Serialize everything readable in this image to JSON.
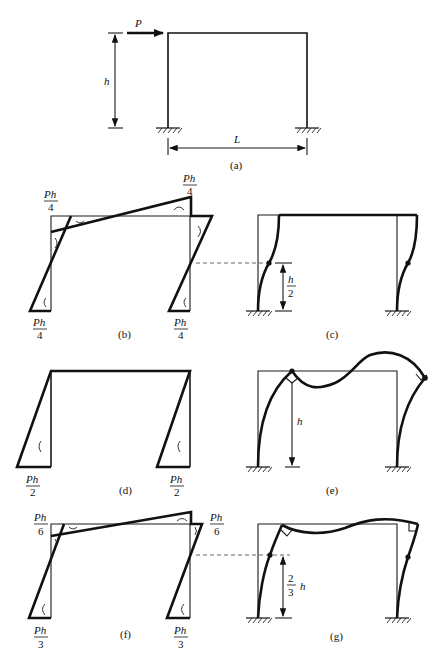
{
  "figure": {
    "panels": [
      {
        "id": "a",
        "caption": "(a)",
        "description": "Portal frame with fixed bases, horizontal load P at beam level",
        "labels": {
          "load": "P",
          "height": "h",
          "span": "L"
        }
      },
      {
        "id": "b",
        "caption": "(b)",
        "description": "Bending moment diagram, rigid beam case",
        "moment_labels": {
          "top_left_num": "Ph",
          "top_left_den": "4",
          "top_right_num": "Ph",
          "top_right_den": "4",
          "base_left_num": "Ph",
          "base_left_den": "4",
          "base_right_num": "Ph",
          "base_right_den": "4"
        }
      },
      {
        "id": "c",
        "caption": "(c)",
        "description": "Deflected shape, inflection point at mid-height",
        "labels": {
          "dim_num": "h",
          "dim_den": "2"
        }
      },
      {
        "id": "d",
        "caption": "(d)",
        "description": "Bending moment diagram, flexible beam case",
        "moment_labels": {
          "base_left_num": "Ph",
          "base_left_den": "2",
          "base_right_num": "Ph",
          "base_right_den": "2"
        }
      },
      {
        "id": "e",
        "caption": "(e)",
        "description": "Deflected shape, pinned-like top joints",
        "labels": {
          "dim": "h"
        }
      },
      {
        "id": "f",
        "caption": "(f)",
        "description": "Bending moment diagram, equal stiffness case",
        "moment_labels": {
          "top_left_num": "Ph",
          "top_left_den": "6",
          "top_right_num": "Ph",
          "top_right_den": "6",
          "base_left_num": "Ph",
          "base_left_den": "3",
          "base_right_num": "Ph",
          "base_right_den": "3"
        }
      },
      {
        "id": "g",
        "caption": "(g)",
        "description": "Deflected shape, inflection point at two-thirds height",
        "labels": {
          "dim_num": "2",
          "dim_den": "3",
          "dim_var": "h"
        }
      }
    ]
  }
}
